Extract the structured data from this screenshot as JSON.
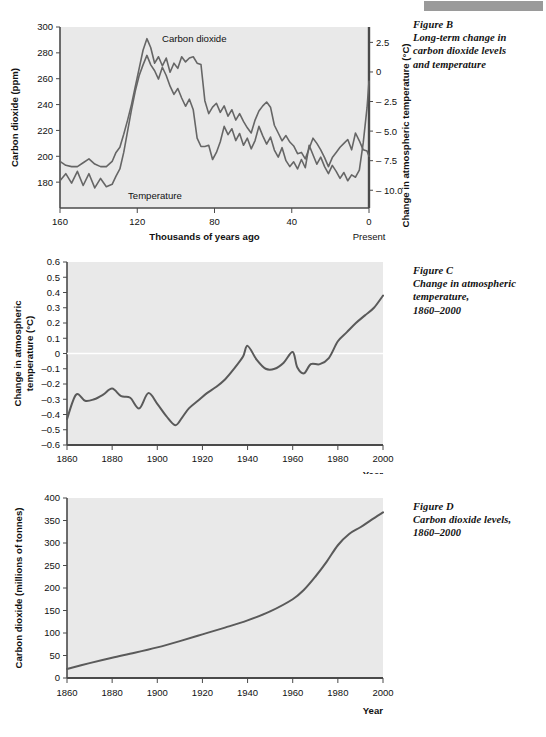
{
  "page": {
    "background": "#ffffff",
    "plot_background": "#e9e9e9",
    "line_color": "#666666",
    "axis_color": "#4a4a4a",
    "top_bar_color": "#9a9a9a"
  },
  "figures": {
    "b": {
      "caption_title": "Figure B",
      "caption_lines": [
        "Long-term change in",
        "carbon dioxide levels",
        "and temperature"
      ]
    },
    "c": {
      "caption_title": "Figure C",
      "caption_lines": [
        "Change in atmospheric",
        "temperature,",
        "1860–2000"
      ]
    },
    "d": {
      "caption_title": "Figure D",
      "caption_lines": [
        "Carbon dioxide levels,",
        "1860–2000"
      ]
    }
  },
  "chart_data": [
    {
      "id": "figure-b",
      "type": "line",
      "title": "Long-term change in carbon dioxide levels and temperature",
      "xlabel": "Thousands of years ago",
      "xlabel_right_note": "Present",
      "ylabel": "Carbon dioxide (ppm)",
      "ylabel_right": "Change in atmospheric temperature (°C)",
      "xlim": [
        160,
        0
      ],
      "x_reversed": true,
      "xticks": [
        160,
        120,
        80,
        40,
        0
      ],
      "xticklabels": [
        "160",
        "120",
        "80",
        "40",
        "0"
      ],
      "ylim": [
        160,
        300
      ],
      "yticks": [
        180,
        200,
        220,
        240,
        260,
        280,
        300
      ],
      "yticklabels": [
        "180",
        "200",
        "220",
        "240",
        "260",
        "280",
        "300"
      ],
      "ylim_right": [
        -11.5,
        3.8
      ],
      "yticks_right": [
        2.5,
        0,
        -2.5,
        -5.0,
        -7.5,
        -10.0
      ],
      "yticklabels_right": [
        "2.5",
        "0",
        "– 2.5",
        "– 5.0",
        "– 7.5",
        "– 10.0"
      ],
      "grid": false,
      "legend": "inline-labels",
      "series": [
        {
          "name": "Carbon dioxide",
          "unit": "ppm",
          "label_position": "inline",
          "x": [
            160,
            157,
            154,
            151,
            148,
            145,
            142,
            139,
            136,
            133,
            131,
            129,
            127,
            125,
            123,
            121,
            119,
            117,
            115,
            113,
            111,
            109,
            107,
            105,
            103,
            101,
            99,
            97,
            95,
            93,
            91,
            89,
            87,
            85,
            83,
            81,
            79,
            77,
            75,
            73,
            71,
            69,
            67,
            65,
            63,
            61,
            59,
            57,
            55,
            53,
            51,
            49,
            47,
            45,
            43,
            41,
            39,
            37,
            35,
            33,
            31,
            29,
            27,
            25,
            23,
            21,
            19,
            17,
            15,
            13,
            11,
            9,
            7,
            5,
            3,
            1,
            0
          ],
          "values": [
            196,
            193,
            192,
            192,
            195,
            198,
            194,
            192,
            192,
            196,
            203,
            207,
            217,
            228,
            240,
            254,
            268,
            282,
            291,
            284,
            272,
            277,
            270,
            276,
            265,
            272,
            268,
            277,
            273,
            276,
            277,
            272,
            271,
            243,
            233,
            238,
            241,
            234,
            239,
            231,
            236,
            228,
            233,
            227,
            222,
            218,
            228,
            235,
            239,
            242,
            238,
            224,
            218,
            212,
            216,
            211,
            208,
            202,
            203,
            198,
            206,
            214,
            210,
            205,
            199,
            192,
            199,
            203,
            207,
            210,
            213,
            205,
            218,
            212,
            205,
            204,
            200,
            196,
            193,
            195,
            200,
            197,
            196,
            193,
            193,
            196,
            212,
            234,
            247,
            257,
            262,
            266
          ]
        },
        {
          "name": "Temperature",
          "unit": "°C change",
          "label_position": "inline",
          "x": [
            160,
            157,
            154,
            151,
            148,
            145,
            142,
            139,
            136,
            133,
            131,
            129,
            127,
            125,
            123,
            121,
            119,
            117,
            115,
            113,
            111,
            109,
            107,
            105,
            103,
            101,
            99,
            97,
            95,
            93,
            91,
            89,
            87,
            85,
            83,
            81,
            79,
            77,
            75,
            73,
            71,
            69,
            67,
            65,
            63,
            61,
            59,
            57,
            55,
            53,
            51,
            49,
            47,
            45,
            43,
            41,
            39,
            37,
            35,
            33,
            31,
            29,
            27,
            25,
            23,
            21,
            19,
            17,
            15,
            13,
            11,
            9,
            7,
            5,
            3,
            1,
            0
          ],
          "values": [
            -9.2,
            -8.6,
            -9.4,
            -8.4,
            -9.6,
            -8.6,
            -9.8,
            -9.0,
            -9.7,
            -9.5,
            -8.8,
            -8.2,
            -6.8,
            -5.0,
            -3.2,
            -1.6,
            -0.3,
            0.6,
            1.4,
            0.6,
            0.1,
            -0.6,
            0.4,
            -0.3,
            -1.2,
            -1.9,
            -1.4,
            -2.2,
            -2.9,
            -2.3,
            -3.2,
            -5.6,
            -6.3,
            -6.3,
            -6.2,
            -7.4,
            -6.8,
            -5.9,
            -4.6,
            -5.3,
            -4.8,
            -5.8,
            -5.2,
            -6.2,
            -5.6,
            -6.5,
            -5.8,
            -4.6,
            -5.4,
            -6.1,
            -5.5,
            -6.6,
            -7.2,
            -6.4,
            -7.5,
            -8.0,
            -7.6,
            -8.2,
            -7.4,
            -8.1,
            -6.2,
            -7.0,
            -7.8,
            -7.2,
            -8.0,
            -8.6,
            -7.9,
            -8.4,
            -9.0,
            -8.5,
            -9.2,
            -8.7,
            -8.9,
            -8.3,
            -6.0,
            -3.0,
            -0.8
          ]
        }
      ]
    },
    {
      "id": "figure-c",
      "type": "line",
      "title": "Change in atmospheric temperature, 1860–2000",
      "xlabel": "Year",
      "ylabel": "Change in atmospheric temperature (°C)",
      "xlim": [
        1860,
        2000
      ],
      "xticks": [
        1860,
        1880,
        1900,
        1920,
        1940,
        1960,
        1980,
        2000
      ],
      "xticklabels": [
        "1860",
        "1880",
        "1900",
        "1920",
        "1940",
        "1960",
        "1980",
        "2000"
      ],
      "ylim": [
        -0.6,
        0.6
      ],
      "yticks": [
        0.6,
        0.5,
        0.4,
        0.3,
        0.2,
        0.1,
        0,
        -0.1,
        -0.2,
        -0.3,
        -0.4,
        -0.5,
        -0.6
      ],
      "yticklabels": [
        "0.6",
        "0.5",
        "0.4",
        "0.3",
        "0.2",
        "0.1",
        "0",
        "–0.1",
        "–0.2",
        "–0.3",
        "–0.4",
        "–0.5",
        "–0.6"
      ],
      "grid": false,
      "zero_line": true,
      "zero_line_color": "#ffffff",
      "series": [
        {
          "name": "Temperature anomaly",
          "unit": "°C",
          "x": [
            1860,
            1864,
            1868,
            1872,
            1876,
            1880,
            1884,
            1888,
            1892,
            1896,
            1900,
            1904,
            1908,
            1911,
            1914,
            1918,
            1922,
            1926,
            1930,
            1934,
            1938,
            1940,
            1944,
            1948,
            1952,
            1956,
            1960,
            1962,
            1965,
            1968,
            1972,
            1976,
            1980,
            1984,
            1988,
            1992,
            1996,
            2000
          ],
          "values": [
            -0.43,
            -0.27,
            -0.31,
            -0.3,
            -0.27,
            -0.23,
            -0.28,
            -0.29,
            -0.36,
            -0.26,
            -0.33,
            -0.41,
            -0.47,
            -0.42,
            -0.36,
            -0.31,
            -0.26,
            -0.22,
            -0.17,
            -0.1,
            -0.02,
            0.05,
            -0.04,
            -0.1,
            -0.1,
            -0.06,
            0.01,
            -0.09,
            -0.13,
            -0.07,
            -0.07,
            -0.03,
            0.08,
            0.14,
            0.2,
            0.25,
            0.3,
            0.38
          ]
        }
      ]
    },
    {
      "id": "figure-d",
      "type": "line",
      "title": "Carbon dioxide levels, 1860–2000",
      "xlabel": "Year",
      "ylabel": "Carbon dioxide (millions of tonnes)",
      "xlim": [
        1860,
        2000
      ],
      "xticks": [
        1860,
        1880,
        1900,
        1920,
        1940,
        1960,
        1980,
        2000
      ],
      "xticklabels": [
        "1860",
        "1880",
        "1900",
        "1920",
        "1940",
        "1960",
        "1980",
        "2000"
      ],
      "ylim": [
        0,
        400
      ],
      "yticks": [
        0,
        50,
        100,
        150,
        200,
        250,
        300,
        350,
        400
      ],
      "yticklabels": [
        "0",
        "50",
        "100",
        "150",
        "200",
        "250",
        "300",
        "350",
        "400"
      ],
      "grid": false,
      "series": [
        {
          "name": "Carbon dioxide emissions",
          "unit": "millions of tonnes",
          "x": [
            1860,
            1870,
            1880,
            1890,
            1900,
            1910,
            1920,
            1930,
            1940,
            1950,
            1960,
            1965,
            1970,
            1975,
            1980,
            1985,
            1990,
            1995,
            2000
          ],
          "values": [
            20,
            33,
            45,
            56,
            68,
            82,
            97,
            112,
            128,
            148,
            175,
            196,
            225,
            258,
            295,
            320,
            335,
            352,
            368
          ]
        }
      ]
    }
  ]
}
